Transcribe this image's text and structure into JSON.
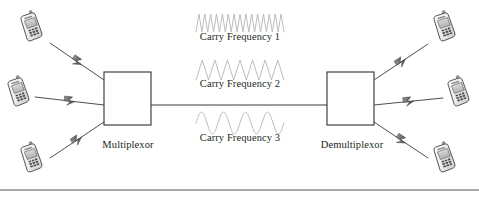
{
  "diagram": {
    "background_color": "#ffffff",
    "stroke_color": "#3a3a3a",
    "text_color": "#231f20",
    "wave_color": "#b9b9bd",
    "nodes": [
      {
        "id": "multiplexor",
        "label": "Multiplexor",
        "x": 104,
        "y": 72,
        "w": 47,
        "h": 53,
        "label_x": 127,
        "label_y": 146
      },
      {
        "id": "demultiplexor",
        "label": "Demultiplexor",
        "x": 327,
        "y": 72,
        "w": 47,
        "h": 53,
        "label_x": 350,
        "label_y": 146
      }
    ],
    "trunk_link": {
      "from_x": 151,
      "to_x": 327,
      "y": 105
    },
    "carriers": [
      {
        "id": "carry-frequency-1",
        "label": "Carry Frequency 1",
        "cycles": 15,
        "amplitude": 9,
        "shape": "triangle",
        "wave_x": 196,
        "wave_y": 14,
        "wave_w": 88,
        "label_x": 240,
        "label_y": 37
      },
      {
        "id": "carry-frequency-2",
        "label": "Carry Frequency 2",
        "cycles": 7,
        "amplitude": 10,
        "shape": "triangle",
        "wave_x": 196,
        "wave_y": 60,
        "wave_w": 88,
        "label_x": 240,
        "label_y": 84
      },
      {
        "id": "carry-frequency-3",
        "label": "Carry Frequency 3",
        "cycles": 4,
        "amplitude": 11,
        "shape": "sine",
        "wave_x": 196,
        "wave_y": 112,
        "wave_w": 88,
        "label_x": 240,
        "label_y": 138
      }
    ],
    "phones": [
      {
        "id": "phone-left-top",
        "side": "left",
        "x": 19,
        "y": 11,
        "w": 22,
        "h": 30,
        "rotate": -16
      },
      {
        "id": "phone-left-middle",
        "side": "left",
        "x": 6,
        "y": 76,
        "w": 22,
        "h": 30,
        "rotate": -16
      },
      {
        "id": "phone-left-bottom",
        "side": "left",
        "x": 19,
        "y": 142,
        "w": 22,
        "h": 30,
        "rotate": -16
      },
      {
        "id": "phone-right-top",
        "side": "right",
        "x": 432,
        "y": 11,
        "w": 22,
        "h": 30,
        "rotate": -16
      },
      {
        "id": "phone-right-middle",
        "side": "right",
        "x": 446,
        "y": 76,
        "w": 22,
        "h": 30,
        "rotate": -16
      },
      {
        "id": "phone-right-bottom",
        "side": "right",
        "x": 432,
        "y": 142,
        "w": 22,
        "h": 30,
        "rotate": -16
      }
    ],
    "wireless_links": [
      {
        "id": "link-left-top",
        "x1": 50,
        "y1": 43,
        "x2": 104,
        "y2": 80
      },
      {
        "id": "link-left-middle",
        "x1": 35,
        "y1": 97,
        "x2": 104,
        "y2": 105
      },
      {
        "id": "link-left-bottom",
        "x1": 50,
        "y1": 158,
        "x2": 104,
        "y2": 122
      },
      {
        "id": "link-right-top",
        "x1": 374,
        "y1": 80,
        "x2": 428,
        "y2": 44
      },
      {
        "id": "link-right-middle",
        "x1": 374,
        "y1": 105,
        "x2": 443,
        "y2": 98
      },
      {
        "id": "link-right-bottom",
        "x1": 374,
        "y1": 122,
        "x2": 428,
        "y2": 158
      }
    ],
    "bottom_rule": {
      "x1": 0,
      "x2": 479,
      "y": 190
    }
  }
}
